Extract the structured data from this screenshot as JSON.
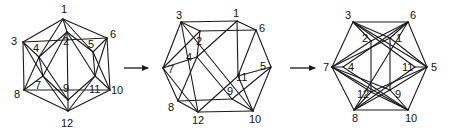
{
  "figure": {
    "stroke_color": "#1a1a1a",
    "background": "#ffffff"
  },
  "arrows": [
    {
      "x1": 124,
      "y1": 68,
      "x2": 148,
      "y2": 68
    },
    {
      "x1": 290,
      "y1": 68,
      "x2": 315,
      "y2": 68
    }
  ],
  "diagrams": [
    {
      "name": "icosahedron-initial",
      "vertices": {
        "1": [
          63,
          19
        ],
        "2": [
          67,
          32
        ],
        "3": [
          23,
          42
        ],
        "4": [
          39,
          57
        ],
        "5": [
          93,
          52
        ],
        "6": [
          107,
          38
        ],
        "7": [
          43,
          76
        ],
        "8": [
          24,
          90
        ],
        "9": [
          68,
          100
        ],
        "10": [
          110,
          90
        ],
        "11": [
          95,
          76
        ],
        "12": [
          68,
          111
        ]
      },
      "labels": {
        "1": [
          61,
          13
        ],
        "2": [
          63,
          45
        ],
        "3": [
          11,
          45
        ],
        "4": [
          33,
          52
        ],
        "5": [
          88,
          48
        ],
        "6": [
          110,
          38
        ],
        "7": [
          35,
          89
        ],
        "8": [
          14,
          98
        ],
        "9": [
          63,
          92
        ],
        "10": [
          111,
          94
        ],
        "11": [
          89,
          93
        ],
        "12": [
          61,
          127
        ]
      },
      "edges": [
        [
          "1",
          "2"
        ],
        [
          "1",
          "3"
        ],
        [
          "1",
          "4"
        ],
        [
          "1",
          "5"
        ],
        [
          "1",
          "6"
        ],
        [
          "3",
          "4"
        ],
        [
          "4",
          "2"
        ],
        [
          "2",
          "5"
        ],
        [
          "5",
          "6"
        ],
        [
          "6",
          "3"
        ],
        [
          "3",
          "8"
        ],
        [
          "3",
          "7"
        ],
        [
          "4",
          "7"
        ],
        [
          "4",
          "9"
        ],
        [
          "2",
          "9"
        ],
        [
          "2",
          "11"
        ],
        [
          "5",
          "11"
        ],
        [
          "5",
          "10"
        ],
        [
          "6",
          "10"
        ],
        [
          "6",
          "11"
        ],
        [
          "8",
          "7"
        ],
        [
          "7",
          "9"
        ],
        [
          "9",
          "11"
        ],
        [
          "11",
          "10"
        ],
        [
          "10",
          "8"
        ],
        [
          "8",
          "12"
        ],
        [
          "7",
          "12"
        ],
        [
          "9",
          "12"
        ],
        [
          "11",
          "12"
        ],
        [
          "10",
          "12"
        ],
        [
          "2",
          "7"
        ],
        [
          "4",
          "8"
        ]
      ]
    },
    {
      "name": "icosahedron-intermediate",
      "vertices": {
        "1": [
          237,
          21
        ],
        "2": [
          200,
          31
        ],
        "3": [
          181,
          22
        ],
        "4": [
          197,
          57
        ],
        "5": [
          271,
          67
        ],
        "6": [
          256,
          30
        ],
        "7": [
          163,
          68
        ],
        "8": [
          178,
          101
        ],
        "9": [
          232,
          99
        ],
        "10": [
          253,
          111
        ],
        "11": [
          238,
          76
        ],
        "12": [
          198,
          112
        ]
      },
      "labels": {
        "1": [
          233,
          17
        ],
        "2": [
          196,
          45
        ],
        "3": [
          176,
          19
        ],
        "4": [
          186,
          61
        ],
        "5": [
          260,
          70
        ],
        "6": [
          259,
          32
        ],
        "7": [
          168,
          73
        ],
        "8": [
          168,
          111
        ],
        "9": [
          227,
          95
        ],
        "10": [
          249,
          123
        ],
        "11": [
          236,
          81
        ],
        "12": [
          192,
          124
        ]
      },
      "edges": [
        [
          "3",
          "1"
        ],
        [
          "1",
          "6"
        ],
        [
          "6",
          "2"
        ],
        [
          "2",
          "3"
        ],
        [
          "3",
          "7"
        ],
        [
          "3",
          "10"
        ],
        [
          "2",
          "7"
        ],
        [
          "2",
          "4"
        ],
        [
          "1",
          "4"
        ],
        [
          "6",
          "5"
        ],
        [
          "6",
          "11"
        ],
        [
          "1",
          "11"
        ],
        [
          "7",
          "4"
        ],
        [
          "7",
          "8"
        ],
        [
          "7",
          "12"
        ],
        [
          "4",
          "8"
        ],
        [
          "4",
          "9"
        ],
        [
          "5",
          "11"
        ],
        [
          "5",
          "10"
        ],
        [
          "5",
          "9"
        ],
        [
          "11",
          "12"
        ],
        [
          "11",
          "10"
        ],
        [
          "8",
          "12"
        ],
        [
          "8",
          "9"
        ],
        [
          "12",
          "10"
        ],
        [
          "9",
          "10"
        ],
        [
          "3",
          "12"
        ]
      ]
    },
    {
      "name": "icosahedron-final",
      "vertices": {
        "1": [
          390,
          38
        ],
        "2": [
          371,
          41
        ],
        "3": [
          353,
          22
        ],
        "4": [
          343,
          67
        ],
        "5": [
          427,
          67
        ],
        "6": [
          408,
          22
        ],
        "7": [
          332,
          67
        ],
        "8": [
          354,
          110
        ],
        "9": [
          390,
          90
        ],
        "10": [
          408,
          110
        ],
        "11": [
          415,
          67
        ],
        "12": [
          371,
          92
        ]
      },
      "labels": {
        "1": [
          396,
          42
        ],
        "2": [
          362,
          42
        ],
        "3": [
          345,
          19
        ],
        "4": [
          348,
          71
        ],
        "5": [
          431,
          71
        ],
        "6": [
          410,
          19
        ],
        "7": [
          323,
          71
        ],
        "8": [
          352,
          122
        ],
        "9": [
          395,
          98
        ],
        "10": [
          405,
          122
        ],
        "11": [
          402,
          71
        ],
        "12": [
          357,
          98
        ]
      },
      "edges": [
        [
          "3",
          "6"
        ],
        [
          "3",
          "7"
        ],
        [
          "6",
          "5"
        ],
        [
          "7",
          "8"
        ],
        [
          "5",
          "10"
        ],
        [
          "8",
          "10"
        ],
        [
          "3",
          "2"
        ],
        [
          "3",
          "1"
        ],
        [
          "3",
          "11"
        ],
        [
          "6",
          "1"
        ],
        [
          "6",
          "2"
        ],
        [
          "6",
          "4"
        ],
        [
          "7",
          "2"
        ],
        [
          "7",
          "4"
        ],
        [
          "7",
          "1"
        ],
        [
          "7",
          "12"
        ],
        [
          "7",
          "9"
        ],
        [
          "5",
          "11"
        ],
        [
          "5",
          "1"
        ],
        [
          "5",
          "9"
        ],
        [
          "5",
          "12"
        ],
        [
          "8",
          "12"
        ],
        [
          "8",
          "9"
        ],
        [
          "8",
          "11"
        ],
        [
          "10",
          "9"
        ],
        [
          "10",
          "12"
        ],
        [
          "10",
          "4"
        ],
        [
          "2",
          "12"
        ],
        [
          "1",
          "9"
        ],
        [
          "3",
          "5"
        ],
        [
          "7",
          "10"
        ],
        [
          "8",
          "6"
        ]
      ]
    }
  ]
}
